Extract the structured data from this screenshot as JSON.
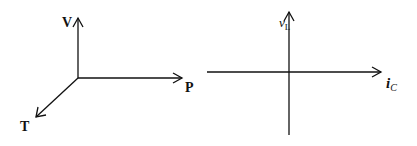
{
  "diagram_left": {
    "axes": [
      {
        "name": "V",
        "direction": "up"
      },
      {
        "name": "P",
        "direction": "right"
      },
      {
        "name": "T",
        "direction": "down-left"
      }
    ],
    "labels": {
      "v": "V",
      "p": "P",
      "t": "T"
    }
  },
  "diagram_right": {
    "labels": {
      "y": "v",
      "y_sub": "L",
      "x": "i",
      "x_sub": "C"
    }
  },
  "colors": {
    "line": "#111111",
    "background": "#ffffff"
  }
}
